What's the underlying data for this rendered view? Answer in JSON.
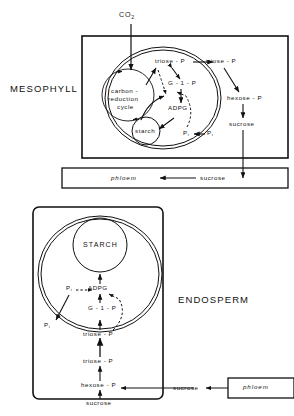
{
  "figure": {
    "input_label": "CO2",
    "input_label_base": "CO",
    "input_label_sub": "2"
  },
  "tissues": {
    "mesophyll": "MESOPHYLL",
    "endosperm": "ENDOSPERM"
  },
  "mesophyll": {
    "chloroplast": {
      "carbon_cycle_line1": "carbon -",
      "carbon_cycle_line2": "reduction",
      "carbon_cycle_line3": "cycle",
      "starch": "starch",
      "triose_p": "triose - P",
      "g1p": "G - 1 - P",
      "adpg": "ADPG",
      "pi_inner": "P",
      "pi_inner_sub": "i"
    },
    "cytosol": {
      "triose_p": "triose - P",
      "hexose_p": "hexose - P",
      "sucrose": "sucrose",
      "pi_outer": "P",
      "pi_outer_sub": "i"
    },
    "phloem": {
      "phloem": "phloem",
      "sucrose": "sucrose"
    }
  },
  "endosperm": {
    "amyloplast": {
      "starch": "STARCH",
      "adpg": "ADPG",
      "g1p": "G - 1 - P",
      "triose_p": "triose - P",
      "pi_inner": "P",
      "pi_inner_sub": "i"
    },
    "cytosol": {
      "pi_outer": "P",
      "pi_outer_sub": "i",
      "triose_p": "triose - P",
      "hexose_p": "hexose - P",
      "sucrose": "sucrose"
    },
    "transport": {
      "sucrose_external": "sucrose",
      "phloem": "phloem"
    }
  },
  "colors": {
    "ink": "#111111",
    "background": "#ffffff"
  }
}
